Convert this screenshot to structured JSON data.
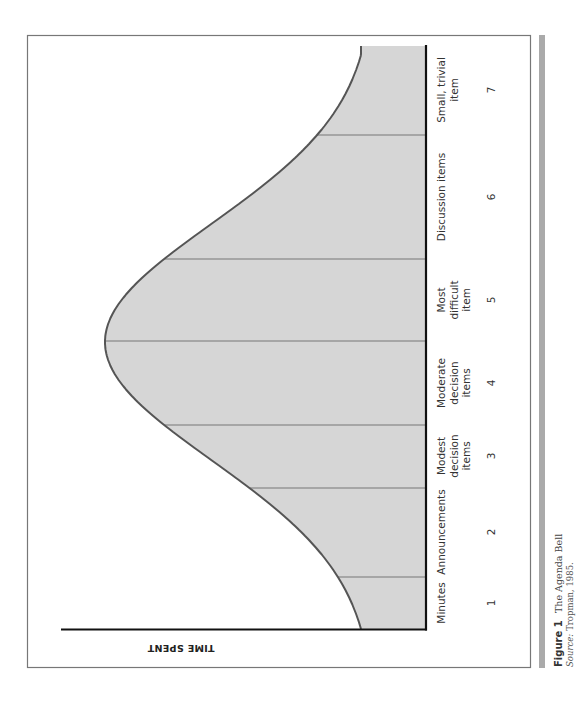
{
  "figure": {
    "label": "Figure 1",
    "title": "The Agenda Bell",
    "source_label": "Source:",
    "source_text": "Tropman, 1985."
  },
  "colors": {
    "fill": "#d6d6d6",
    "curve": "#555555",
    "divider": "#777777",
    "axis": "#111111",
    "frame": "#777777",
    "side_bar": "#aaaaaa"
  },
  "chart_data": {
    "type": "area",
    "title": "The Agenda Bell",
    "orientation": "rotated 90 degrees counter-clockwise on page",
    "xlabel": "",
    "ylabel": "TIME SPENT",
    "categories": [
      "1",
      "2",
      "3",
      "4",
      "5",
      "6",
      "7"
    ],
    "category_labels": [
      [
        "Minutes"
      ],
      [
        "Announcements"
      ],
      [
        "Modest",
        "decision",
        "items"
      ],
      [
        "Moderate",
        "decision",
        "items"
      ],
      [
        "Most",
        "difficult",
        "item"
      ],
      [
        "Discussion items"
      ],
      [
        "Small, trivial",
        "item"
      ]
    ],
    "x": [
      1,
      2,
      3,
      4,
      5,
      6,
      7
    ],
    "values_relative": [
      0.08,
      0.35,
      0.82,
      1.0,
      0.9,
      0.45,
      0.1
    ],
    "peak_position": 4.5,
    "grid": false,
    "legend": "none",
    "note": "Bell-shaped curve; shaded area under curve divided into 7 agenda segments"
  }
}
